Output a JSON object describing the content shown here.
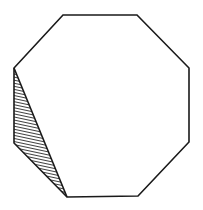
{
  "diagram": {
    "type": "regular-octagon-with-shaded-triangle",
    "canvas": {
      "width": 203,
      "height": 210,
      "background": "#ffffff"
    },
    "stroke_color": "#1a1a1a",
    "stroke_width": 1.6,
    "hatch_color": "#2a2a2a",
    "hatch_spacing": 3,
    "octagon_vertices": [
      [
        63,
        15
      ],
      [
        137,
        15
      ],
      [
        189,
        68
      ],
      [
        189,
        142
      ],
      [
        138,
        196
      ],
      [
        67,
        197
      ],
      [
        14,
        143
      ],
      [
        14,
        68
      ]
    ],
    "shaded_triangle_vertices": [
      [
        14,
        68
      ],
      [
        14,
        143
      ],
      [
        67,
        197
      ]
    ],
    "shading_style": "hatched"
  }
}
